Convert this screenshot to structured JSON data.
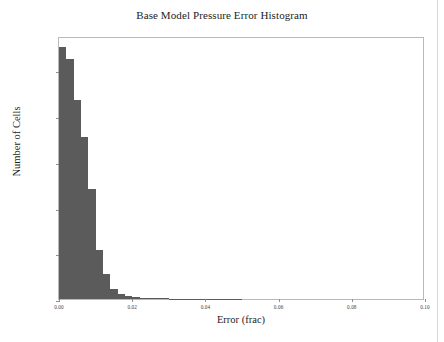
{
  "chart_data": {
    "type": "bar",
    "title": "Base Model Pressure Error Histogram",
    "xlabel": "Error (frac)",
    "ylabel": "Number of Cells",
    "xlim": [
      0.0,
      0.1
    ],
    "ylim": [
      0,
      1150000
    ],
    "grid": false,
    "legend": null,
    "bin_width": 0.002,
    "bar_color": "#5b5b5b",
    "x_tick_labels": [
      "0.00",
      "0.02",
      "0.04",
      "0.06",
      "0.08",
      "0.10"
    ],
    "x_tick_values": [
      0.0,
      0.02,
      0.04,
      0.06,
      0.08,
      0.1
    ],
    "y_tick_labels": [
      "0",
      "200,000",
      "400,000",
      "600,000",
      "800,000",
      "1,000,000"
    ],
    "y_tick_values": [
      0,
      200000,
      400000,
      600000,
      800000,
      1000000
    ],
    "bins": [
      {
        "x0": 0.0,
        "x1": 0.002,
        "value": 1100000
      },
      {
        "x0": 0.002,
        "x1": 0.004,
        "value": 1050000
      },
      {
        "x0": 0.004,
        "x1": 0.006,
        "value": 870000
      },
      {
        "x0": 0.006,
        "x1": 0.008,
        "value": 710000
      },
      {
        "x0": 0.008,
        "x1": 0.01,
        "value": 480000
      },
      {
        "x0": 0.01,
        "x1": 0.012,
        "value": 215000
      },
      {
        "x0": 0.012,
        "x1": 0.014,
        "value": 110000
      },
      {
        "x0": 0.014,
        "x1": 0.016,
        "value": 45000
      },
      {
        "x0": 0.016,
        "x1": 0.018,
        "value": 22000
      },
      {
        "x0": 0.018,
        "x1": 0.02,
        "value": 12000
      },
      {
        "x0": 0.02,
        "x1": 0.022,
        "value": 8000
      },
      {
        "x0": 0.022,
        "x1": 0.024,
        "value": 5500
      },
      {
        "x0": 0.024,
        "x1": 0.026,
        "value": 4000
      },
      {
        "x0": 0.026,
        "x1": 0.028,
        "value": 3000
      },
      {
        "x0": 0.028,
        "x1": 0.03,
        "value": 2400
      },
      {
        "x0": 0.03,
        "x1": 0.032,
        "value": 1900
      },
      {
        "x0": 0.032,
        "x1": 0.034,
        "value": 1500
      },
      {
        "x0": 0.034,
        "x1": 0.036,
        "value": 1200
      },
      {
        "x0": 0.036,
        "x1": 0.038,
        "value": 1000
      },
      {
        "x0": 0.038,
        "x1": 0.04,
        "value": 800
      },
      {
        "x0": 0.04,
        "x1": 0.042,
        "value": 700
      },
      {
        "x0": 0.042,
        "x1": 0.044,
        "value": 600
      },
      {
        "x0": 0.044,
        "x1": 0.046,
        "value": 500
      },
      {
        "x0": 0.046,
        "x1": 0.048,
        "value": 450
      },
      {
        "x0": 0.048,
        "x1": 0.05,
        "value": 400
      }
    ]
  }
}
